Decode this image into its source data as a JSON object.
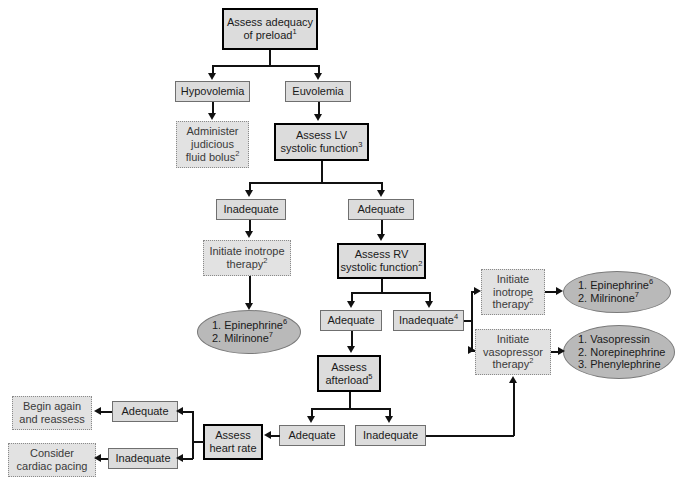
{
  "diagram": {
    "colors": {
      "node_fill": "#dcdcdc",
      "dotted_fill": "#e2e2e2",
      "ellipse_fill": "#b9b9b9",
      "line": "#111111",
      "heavy_border": "#000000",
      "thin_border": "#6f6f6f",
      "dotted_border": "#8a8a8a",
      "background": "#ffffff"
    }
  },
  "nodes": {
    "assess_preload": {
      "line1": "Assess adequacy",
      "line2": "of preload",
      "sup": "1"
    },
    "hypovolemia": {
      "label": "Hypovolemia"
    },
    "euvolemia": {
      "label": "Euvolemia"
    },
    "fluid_bolus": {
      "line1": "Administer",
      "line2": "judicious",
      "line3": "fluid bolus",
      "sup": "2"
    },
    "assess_lv": {
      "line1": "Assess LV",
      "line2": "systolic function",
      "sup": "3"
    },
    "lv_inadequate": {
      "label": "Inadequate"
    },
    "lv_adequate": {
      "label": "Adequate"
    },
    "initiate_inotrope_left": {
      "line1": "Initiate inotrope",
      "line2": "therapy",
      "sup": "2"
    },
    "drugs_inotrope_left": {
      "item1": "1. Epinephrine",
      "sup1": "6",
      "item2": "2. Milrinone",
      "sup2": "7"
    },
    "assess_rv": {
      "line1": "Assess RV",
      "line2": "systolic function",
      "sup": "2"
    },
    "rv_adequate": {
      "label": "Adequate"
    },
    "rv_inadequate": {
      "label": "Inadequate",
      "sup": "4"
    },
    "initiate_inotrope_right": {
      "line1": "Initiate",
      "line2": "inotrope",
      "line3": "therapy",
      "sup": "2"
    },
    "drugs_inotrope_right": {
      "item1": "1. Epinephrine",
      "sup1": "6",
      "item2": "2. Milrinone",
      "sup2": "7"
    },
    "initiate_vasopressor": {
      "line1": "Initiate",
      "line2": "vasopressor",
      "line3": "therapy",
      "sup": "2"
    },
    "drugs_vasopressor": {
      "item1": "1. Vasopressin",
      "item2": "2. Norepinephrine",
      "item3": "3. Phenylephrine"
    },
    "assess_afterload": {
      "line1": "Assess",
      "line2": "afterload",
      "sup": "5"
    },
    "afterload_adequate": {
      "label": "Adequate"
    },
    "afterload_inadequate": {
      "label": "Inadequate"
    },
    "assess_heart_rate": {
      "line1": "Assess",
      "line2": "heart rate"
    },
    "hr_adequate": {
      "label": "Adequate"
    },
    "hr_inadequate": {
      "label": "Inadequate"
    },
    "begin_again": {
      "line1": "Begin again",
      "line2": "and reassess"
    },
    "cardiac_pacing": {
      "line1": "Consider",
      "line2": "cardiac pacing"
    }
  }
}
